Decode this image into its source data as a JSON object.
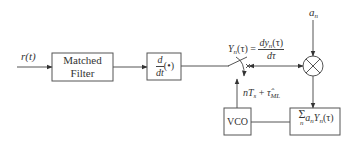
{
  "diagram": {
    "type": "block-diagram",
    "input": {
      "label": "r(t)"
    },
    "blocks": {
      "matched_filter": {
        "line1": "Matched",
        "line2": "Filter"
      },
      "differentiator": {
        "num": "d",
        "den": "dt",
        "arg": "(•)"
      },
      "multiplier": {
        "symbol": "×"
      },
      "summer": {
        "sigma": "Σ",
        "sigma_sub": "n",
        "body": "a",
        "body_sub": "n",
        "y": "Y",
        "y_sub": "n",
        "arg": "(τ)"
      },
      "vco": {
        "label": "VCO"
      }
    },
    "labels": {
      "yn_lhs": "Y",
      "yn_lhs_sub": "n",
      "yn_lhs_arg": "(τ) =",
      "yn_num": "dy",
      "yn_num_sub": "n",
      "yn_num_arg": "(τ)",
      "yn_den": "dτ",
      "an": "a",
      "an_sub": "n",
      "sample_n": "nT",
      "sample_s": "s",
      "sample_plus": " + ",
      "sample_tau": "τ̂",
      "sample_ml": "ML"
    },
    "colors": {
      "stroke": "#444444",
      "background": "#ffffff"
    }
  }
}
